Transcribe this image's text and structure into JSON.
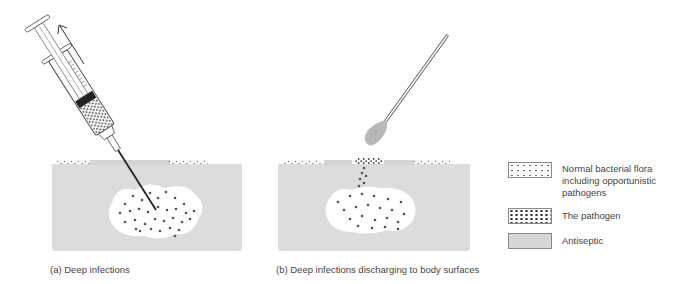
{
  "figure": {
    "panels": [
      {
        "id": "a",
        "caption": "(a)  Deep infections",
        "instrument": "syringe",
        "arrow_direction": "up"
      },
      {
        "id": "b",
        "caption": "(b)  Deep infections discharging to body surfaces",
        "instrument": "swab"
      }
    ],
    "legend": [
      {
        "label_lines": [
          "Normal bacterial flora",
          "including opportunistic",
          "pathogens"
        ],
        "pattern": "sparse-dots"
      },
      {
        "label_lines": [
          "The pathogen"
        ],
        "pattern": "dense-dots"
      },
      {
        "label_lines": [
          "Antiseptic"
        ],
        "pattern": "grey-fill"
      }
    ],
    "colors": {
      "tissue": "#dcdcdc",
      "lesion": "#ffffff",
      "dot": "#555555",
      "outline": "#555555",
      "antiseptic": "#d6d6d6"
    }
  }
}
